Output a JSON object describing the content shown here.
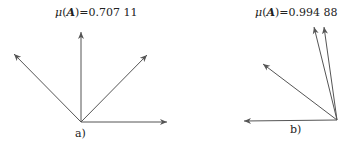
{
  "figures": [
    {
      "id": "a",
      "caption": "a)",
      "mu_symbol": "μ",
      "mu_arg": "A",
      "mu_value": "0.707 11",
      "origin": [
        81,
        122
      ],
      "vectors": [
        [
          81,
          32
        ],
        [
          14,
          54
        ],
        [
          147,
          55
        ],
        [
          167,
          122
        ]
      ]
    },
    {
      "id": "b",
      "caption": "b)",
      "mu_symbol": "μ",
      "mu_arg": "A",
      "mu_value": "0.994 88",
      "origin": [
        337,
        120
      ],
      "vectors": [
        [
          314,
          27
        ],
        [
          324,
          27
        ],
        [
          263,
          64
        ],
        [
          244,
          121
        ]
      ]
    }
  ],
  "colors": {
    "arrow": "#555555",
    "text": "#222222"
  }
}
